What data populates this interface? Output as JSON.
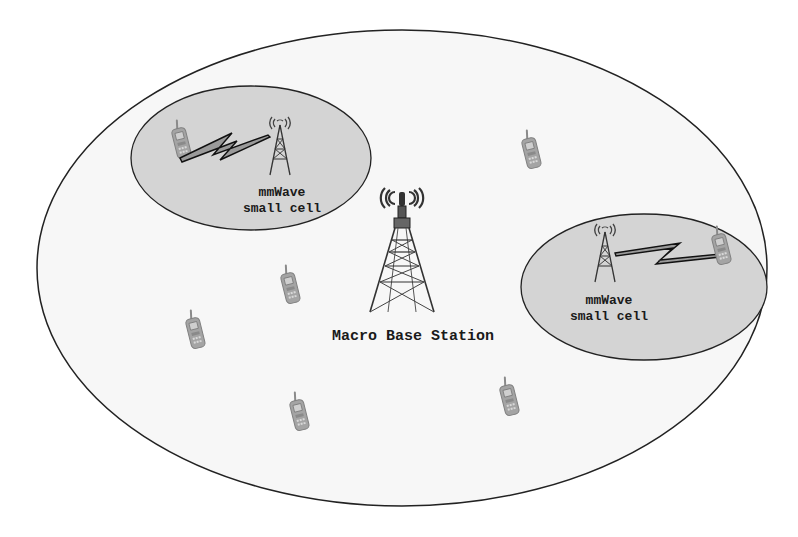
{
  "diagram": {
    "type": "heterogeneous-network-illustration",
    "colors": {
      "background": "#ffffff",
      "macro_cell_fill": "#f7f7f7",
      "small_cell_fill": "#d4d4d4",
      "outline": "#222222",
      "phone": "#9a9a9a",
      "link_fill": "#9a9a9a"
    },
    "macro_cell": {
      "label": "Macro Base Station",
      "icon": "transmission-tower-icon"
    },
    "small_cells": [
      {
        "id": "small-cell-left",
        "label_line1": "mmWave",
        "label_line2": "small cell",
        "icon": "antenna-tower-icon",
        "link_icon": "lightning-link-icon"
      },
      {
        "id": "small-cell-right",
        "label_line1": "mmWave",
        "label_line2": "small cell",
        "icon": "antenna-tower-icon",
        "link_icon": "lightning-link-icon"
      }
    ],
    "user_equipment": {
      "icon": "mobile-phone-icon",
      "count": 7
    }
  }
}
